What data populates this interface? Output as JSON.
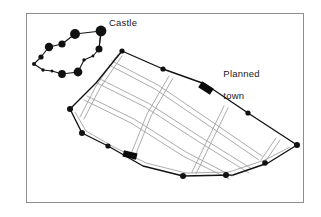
{
  "figure": {
    "type": "historical town plan diagram",
    "background_color": "#ffffff",
    "frame": {
      "stroke": "#8d8d8d",
      "x": 26,
      "y": 13,
      "width": 278,
      "height": 190
    }
  },
  "labels": {
    "castle": "Castle",
    "planned_town_line1": "Planned",
    "planned_town_line2": "town"
  },
  "legend_semantics": {
    "filled_circle": "tower / wall vertex",
    "filled_rectangle": "town gate",
    "double_line": "street",
    "single_line": "town wall / castle curtain wall"
  },
  "colors": {
    "ink": "#111111",
    "street": "#9a9a9a",
    "frame": "#8d8d8d",
    "label": "#1a1a1a"
  },
  "geometry": {
    "castle": {
      "name": "Castle",
      "wall_path": "M 101,31 L 75,34 L 62,44 L 49,47 L 41,57 L 34,64 L 43,70 L 52,71 L 62,74 L 78,72 L 84,60 L 93,56 L 99,49 L 101,31 Z",
      "towers": [
        {
          "cx": 101,
          "cy": 31,
          "r": 5.4,
          "role": "great-tower"
        },
        {
          "cx": 75,
          "cy": 34,
          "r": 4.9,
          "role": "tower"
        },
        {
          "cx": 62,
          "cy": 44,
          "r": 3.6,
          "role": "tower"
        },
        {
          "cx": 49,
          "cy": 47,
          "r": 4.2,
          "role": "tower"
        },
        {
          "cx": 41,
          "cy": 57,
          "r": 2.6,
          "role": "tower"
        },
        {
          "cx": 34,
          "cy": 64,
          "r": 2.0,
          "role": "turret"
        },
        {
          "cx": 43,
          "cy": 70,
          "r": 1.7,
          "role": "turret"
        },
        {
          "cx": 52,
          "cy": 71,
          "r": 1.5,
          "role": "turret"
        },
        {
          "cx": 62,
          "cy": 74,
          "r": 3.9,
          "role": "tower"
        },
        {
          "cx": 78,
          "cy": 72,
          "r": 4.4,
          "role": "tower"
        },
        {
          "cx": 84,
          "cy": 60,
          "r": 1.7,
          "role": "turret"
        },
        {
          "cx": 93,
          "cy": 56,
          "r": 1.4,
          "role": "turret"
        },
        {
          "cx": 99,
          "cy": 49,
          "r": 3.5,
          "role": "tower"
        }
      ],
      "link_to_town": "M 101,31 L 99,49"
    },
    "town": {
      "name": "Planned town",
      "wall_path": "M 122,51 L 163,69 L 205,84 L 248,113 L 297,145 L 268,163 L 233,175 L 183,176 L 143,166 L 108,146 L 82,133 L 70,109 L 96,83 Z",
      "wall_vertices": [
        {
          "cx": 122,
          "cy": 51,
          "r": 2.6
        },
        {
          "cx": 163,
          "cy": 69,
          "r": 2.6
        },
        {
          "cx": 248,
          "cy": 113,
          "r": 2.6
        },
        {
          "cx": 297,
          "cy": 145,
          "r": 3.0
        },
        {
          "cx": 265,
          "cy": 163,
          "r": 2.8
        },
        {
          "cx": 226,
          "cy": 175,
          "r": 3.0
        },
        {
          "cx": 183,
          "cy": 176,
          "r": 3.0
        },
        {
          "cx": 108,
          "cy": 146,
          "r": 2.6
        },
        {
          "cx": 82,
          "cy": 133,
          "r": 3.0
        },
        {
          "cx": 70,
          "cy": 109,
          "r": 3.0
        }
      ],
      "gates": [
        {
          "x": 200,
          "y": 88,
          "w": 12,
          "h": 7,
          "rotate": 32,
          "label": "north-east gate"
        },
        {
          "x": 123,
          "y": 152,
          "w": 13,
          "h": 6,
          "rotate": 15,
          "label": "south-west gate"
        }
      ],
      "streets_longitudinal": [
        "M 110,62 L 155,86 L 205,119 L 258,156",
        "M 99,77 L 146,101 L 197,134 L 249,167",
        "M 86,95 L 133,118 L 184,151 L 230,176"
      ],
      "streets_transverse": [
        "M 118,55 L 95,86 L 79,116",
        "M 170,77 L 148,115 L 131,158",
        "M 226,108 L 206,146 L 194,172",
        "M 277,140 L 262,161"
      ]
    }
  }
}
